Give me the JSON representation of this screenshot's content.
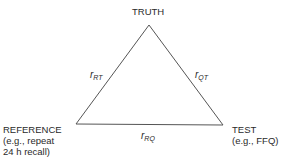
{
  "diagram": {
    "type": "triangle",
    "nodes": {
      "truth": {
        "label": "TRUTH"
      },
      "reference": {
        "label": "REFERENCE",
        "sub1": "(e.g., repeat",
        "sub2": "24 h recall)"
      },
      "test": {
        "label": "TEST",
        "sub1": "(e.g., FFQ)"
      }
    },
    "edges": {
      "rt": {
        "symbol": "r",
        "subscript": "RT"
      },
      "qt": {
        "symbol": "r",
        "subscript": "QT"
      },
      "rq": {
        "symbol": "r",
        "subscript": "RQ"
      }
    },
    "colors": {
      "line": "#555555",
      "text": "#2a2a2a"
    }
  }
}
